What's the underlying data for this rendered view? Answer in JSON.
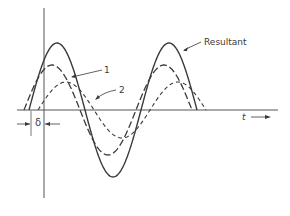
{
  "diagram": {
    "labels": {
      "resultant": "Resultant",
      "wave1": "1",
      "wave2": "2",
      "delta": "δ",
      "t_axis": "t"
    },
    "colors": {
      "stroke": "#3a3a3a",
      "axis": "#555555",
      "background": "#ffffff"
    },
    "axes": {
      "origin_x": 44,
      "baseline_y": 110,
      "vertical_top": 8,
      "vertical_bottom": 198,
      "horizontal_left": 17,
      "horizontal_right": 278
    },
    "waves": [
      {
        "id": "resultant",
        "style": "solid",
        "amplitude": 67,
        "start_x": 29,
        "period": 112,
        "cycles": 1.5
      },
      {
        "id": "wave1",
        "style": "long-dash",
        "amplitude": 45,
        "start_x": 24,
        "period": 112,
        "cycles": 1.5
      },
      {
        "id": "wave2",
        "style": "short-dash",
        "amplitude": 28,
        "start_x": 38,
        "period": 112,
        "cycles": 1.5
      }
    ]
  }
}
